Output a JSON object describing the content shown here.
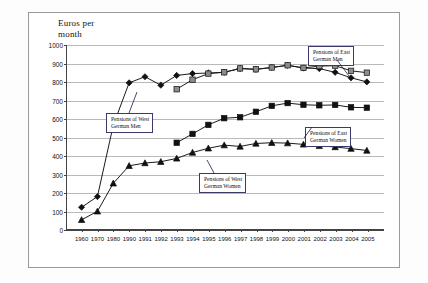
{
  "figure": {
    "axis_title_line1": "Euros per",
    "axis_title_line2": "month"
  },
  "annotations": [
    {
      "name": "west-men",
      "line1": "Pensions of West",
      "line2": "German Men"
    },
    {
      "name": "east-men",
      "line1": "Pensions of East",
      "line2": "German Men"
    },
    {
      "name": "east-women",
      "line1": "Pensions of East",
      "line2": "German Women"
    },
    {
      "name": "west-women",
      "line1": "Pensions of West",
      "line2": "German Women"
    }
  ],
  "chart_data": {
    "type": "line",
    "title": "Euros per month",
    "xlabel": "",
    "ylabel": "Euros per month",
    "ylim": [
      0,
      1000
    ],
    "ytick_step": 100,
    "yticks": [
      0,
      100,
      200,
      300,
      400,
      500,
      600,
      700,
      800,
      900,
      1000
    ],
    "grid": true,
    "legend": "annotated-callouts",
    "categories": [
      "1960",
      "1970",
      "1980",
      "1990",
      "1991",
      "1992",
      "1993",
      "1994",
      "1995",
      "1996",
      "1997",
      "1998",
      "1999",
      "2000",
      "2001",
      "2002",
      "2003",
      "2004",
      "2005"
    ],
    "series": [
      {
        "name": "Pensions of West German Men",
        "marker": "diamond",
        "color": "#111111",
        "values": [
          120,
          178,
          565,
          795,
          828,
          782,
          835,
          845,
          848,
          852,
          872,
          868,
          878,
          890,
          875,
          872,
          852,
          822,
          800
        ]
      },
      {
        "name": "Pensions of West German Women",
        "marker": "triangle",
        "color": "#111111",
        "values": [
          52,
          98,
          250,
          345,
          360,
          367,
          385,
          417,
          440,
          457,
          450,
          466,
          470,
          468,
          461,
          453,
          447,
          438,
          428
        ]
      },
      {
        "name": "Pensions of East German Men",
        "marker": "square",
        "color": "#8c8c8c",
        "values": [
          null,
          null,
          null,
          null,
          null,
          null,
          760,
          812,
          845,
          852,
          873,
          868,
          878,
          890,
          876,
          885,
          888,
          860,
          850
        ]
      },
      {
        "name": "Pensions of East German Women",
        "marker": "square",
        "color": "#111111",
        "values": [
          null,
          null,
          null,
          null,
          null,
          null,
          470,
          518,
          567,
          603,
          608,
          638,
          670,
          685,
          676,
          673,
          675,
          662,
          660
        ]
      }
    ]
  }
}
